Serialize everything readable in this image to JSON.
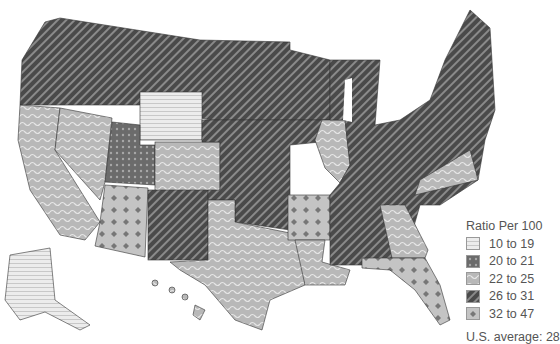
{
  "map": {
    "subject": "United States ratio per 100 by state",
    "legend": {
      "title": "Ratio Per 100",
      "items": [
        {
          "label": "10 to 19",
          "pattern": "horizontal-stripes",
          "color": "#e2e2e2"
        },
        {
          "label": "20 to 21",
          "pattern": "dots",
          "color": "#6b6b6b"
        },
        {
          "label": "22 to 25",
          "pattern": "waves",
          "color": "#b8b8b8"
        },
        {
          "label": "26 to 31",
          "pattern": "diagonal-stripes",
          "color": "#4a4a4a"
        },
        {
          "label": "32 to 47",
          "pattern": "diamonds",
          "color": "#c4c4c4"
        }
      ]
    },
    "average": "U.S. average: 28",
    "states_by_class": {
      "10 to 19": [
        "WY",
        "AK"
      ],
      "20 to 21": [
        "UT"
      ],
      "22 to 25": [
        "CA",
        "NV",
        "CO",
        "TX",
        "LA",
        "IL",
        "VA",
        "GA",
        "HI"
      ],
      "26 to 31": [
        "WA",
        "OR",
        "ID",
        "MT",
        "ND",
        "SD",
        "NE",
        "KS",
        "MN",
        "IA",
        "MO",
        "WI",
        "MI",
        "IN",
        "OH",
        "KY",
        "TN",
        "MS",
        "AL",
        "WV",
        "PA",
        "NY",
        "ME",
        "VT",
        "NH",
        "MA",
        "NJ",
        "MD",
        "NC",
        "SC",
        "NM",
        "OK"
      ],
      "32 to 47": [
        "AZ",
        "AR",
        "FL"
      ]
    }
  }
}
